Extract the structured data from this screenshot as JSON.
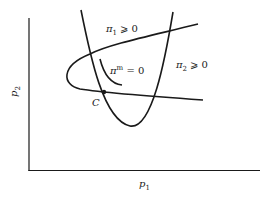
{
  "diagram": {
    "type": "economic-constraint-curves",
    "axes": {
      "x_label": "p",
      "x_label_sub": "1",
      "y_label": "p",
      "y_label_sub": "2"
    },
    "curves": [
      {
        "id": "pi1",
        "label_base": "π",
        "label_sub": "1",
        "label_rel": " ⩾ 0"
      },
      {
        "id": "pi2",
        "label_base": "π",
        "label_sub": "2",
        "label_rel": " ⩾ 0"
      },
      {
        "id": "pim",
        "label_base": "π",
        "label_sup": "m",
        "label_rel": " = 0"
      }
    ],
    "points": [
      {
        "id": "C",
        "label": "C"
      }
    ],
    "colors": {
      "line": "#1a1a1a",
      "background": "#ffffff"
    }
  }
}
